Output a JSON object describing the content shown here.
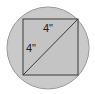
{
  "diagram": {
    "shapes": {
      "circle": {
        "cx": 48,
        "cy": 48,
        "r": 41
      },
      "square": {
        "x": 23,
        "y": 19,
        "size": 55
      },
      "diagonal": {
        "from": "bottom-left",
        "to": "top-right"
      }
    },
    "labels": {
      "top_side": "4\"",
      "left_side": "4\""
    },
    "colors": {
      "circle_fill": "#c9c9c9",
      "circle_stroke": "#9a9a9a",
      "square_fill": "#c4c4c4",
      "line": "#3a3a3a"
    }
  }
}
